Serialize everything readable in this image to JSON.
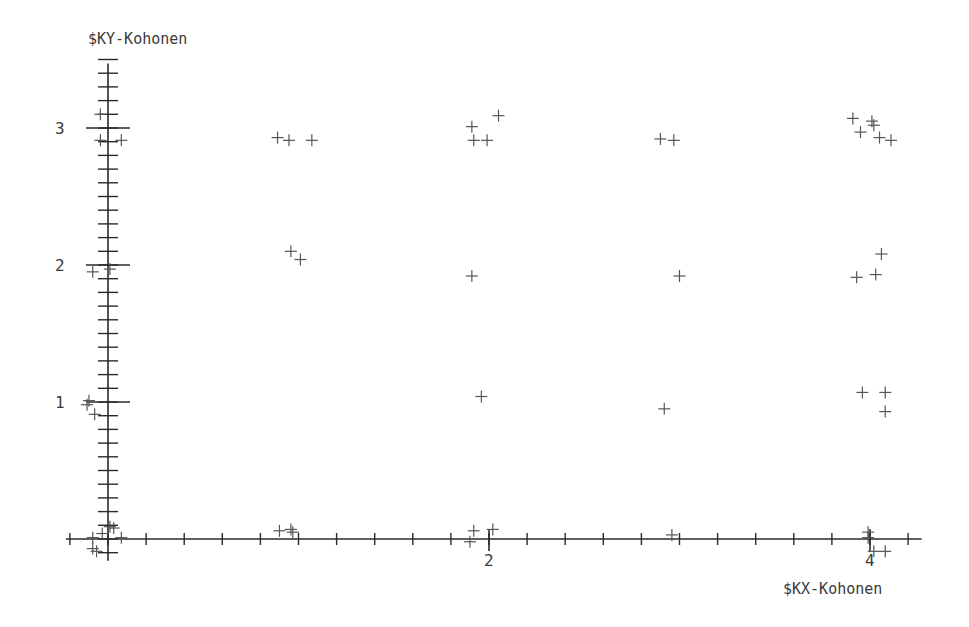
{
  "chart_data": {
    "type": "scatter",
    "title": "",
    "xlabel": "$KX-Kohonen",
    "ylabel": "$KY-Kohonen",
    "xlim": [
      -0.2,
      4.25
    ],
    "ylim": [
      -0.1,
      3.5
    ],
    "x_major_ticks": [
      2,
      4
    ],
    "y_major_ticks": [
      1,
      2,
      3
    ],
    "x_minor_step": 0.2,
    "y_minor_step": 0.1,
    "grid": false,
    "legend": null,
    "marker": "+",
    "color": "#555555",
    "points": [
      {
        "x": -0.04,
        "y": 3.1
      },
      {
        "x": -0.04,
        "y": 2.91
      },
      {
        "x": 0.07,
        "y": 2.91
      },
      {
        "x": 0.89,
        "y": 2.93
      },
      {
        "x": 0.95,
        "y": 2.91
      },
      {
        "x": 1.07,
        "y": 2.91
      },
      {
        "x": 0.96,
        "y": 2.1
      },
      {
        "x": 1.01,
        "y": 2.04
      },
      {
        "x": 1.91,
        "y": 3.01
      },
      {
        "x": 1.92,
        "y": 2.91
      },
      {
        "x": 1.99,
        "y": 2.91
      },
      {
        "x": 2.05,
        "y": 3.09
      },
      {
        "x": 1.91,
        "y": 1.92
      },
      {
        "x": 1.96,
        "y": 1.04
      },
      {
        "x": 2.9,
        "y": 2.92
      },
      {
        "x": 2.97,
        "y": 2.91
      },
      {
        "x": 3.0,
        "y": 1.92
      },
      {
        "x": 2.92,
        "y": 0.95
      },
      {
        "x": 3.91,
        "y": 3.07
      },
      {
        "x": 4.01,
        "y": 3.05
      },
      {
        "x": 4.02,
        "y": 3.02
      },
      {
        "x": 3.95,
        "y": 2.97
      },
      {
        "x": 4.05,
        "y": 2.93
      },
      {
        "x": 4.11,
        "y": 2.91
      },
      {
        "x": 4.06,
        "y": 2.08
      },
      {
        "x": 3.93,
        "y": 1.91
      },
      {
        "x": 4.03,
        "y": 1.93
      },
      {
        "x": 3.96,
        "y": 1.07
      },
      {
        "x": 4.08,
        "y": 1.07
      },
      {
        "x": 4.08,
        "y": 0.93
      },
      {
        "x": -0.1,
        "y": 1.01
      },
      {
        "x": -0.11,
        "y": 0.98
      },
      {
        "x": -0.07,
        "y": 0.91
      },
      {
        "x": -0.08,
        "y": 1.95
      },
      {
        "x": 0.01,
        "y": 1.97
      },
      {
        "x": 0.01,
        "y": 0.09
      },
      {
        "x": 0.03,
        "y": 0.08
      },
      {
        "x": -0.08,
        "y": 0.01
      },
      {
        "x": -0.03,
        "y": 0.04
      },
      {
        "x": 0.07,
        "y": 0.01
      },
      {
        "x": -0.08,
        "y": -0.07
      },
      {
        "x": -0.06,
        "y": -0.09
      },
      {
        "x": 0.9,
        "y": 0.06
      },
      {
        "x": 0.96,
        "y": 0.07
      },
      {
        "x": 0.97,
        "y": 0.05
      },
      {
        "x": 1.92,
        "y": 0.06
      },
      {
        "x": 2.02,
        "y": 0.07
      },
      {
        "x": 1.9,
        "y": -0.02
      },
      {
        "x": 2.96,
        "y": 0.03
      },
      {
        "x": 3.99,
        "y": 0.05
      },
      {
        "x": 3.99,
        "y": 0.01
      },
      {
        "x": 4.02,
        "y": -0.09
      },
      {
        "x": 4.08,
        "y": -0.09
      }
    ]
  },
  "axes": {
    "x_label": "$KX-Kohonen",
    "y_label": "$KY-Kohonen",
    "x_tick_labels": [
      "2",
      "4"
    ],
    "y_tick_labels": [
      "1",
      "2",
      "3"
    ]
  }
}
